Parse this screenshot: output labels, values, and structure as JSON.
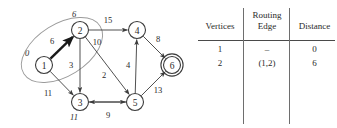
{
  "graph": {
    "nodes": [
      {
        "id": "1",
        "label": "1",
        "cx": 44,
        "cy": 65,
        "distance": "0",
        "dist_dx": -17,
        "dist_dy": -9,
        "highlighted": false
      },
      {
        "id": "2",
        "label": "2",
        "cx": 80,
        "cy": 30,
        "distance": "6",
        "dist_dx": -6,
        "dist_dy": -13,
        "highlighted": false
      },
      {
        "id": "3",
        "label": "3",
        "cx": 80,
        "cy": 102,
        "distance": "11",
        "dist_dx": -6,
        "dist_dy": 18,
        "highlighted": false
      },
      {
        "id": "4",
        "label": "4",
        "cx": 137,
        "cy": 30,
        "distance": "",
        "dist_dx": 0,
        "dist_dy": 0,
        "highlighted": false
      },
      {
        "id": "5",
        "label": "5",
        "cx": 135,
        "cy": 102,
        "distance": "",
        "dist_dx": 0,
        "dist_dy": 0,
        "highlighted": false
      },
      {
        "id": "6",
        "label": "6",
        "cx": 172,
        "cy": 65,
        "distance": "",
        "dist_dx": 0,
        "dist_dy": 0,
        "highlighted": true
      }
    ],
    "edges": [
      {
        "from": "1",
        "to": "2",
        "weight": "6",
        "wx": 52,
        "wy": 44,
        "thick": true
      },
      {
        "from": "1",
        "to": "3",
        "weight": "11",
        "wx": 48,
        "wy": 96,
        "thick": false
      },
      {
        "from": "2",
        "to": "3",
        "weight": "3",
        "wx": 71,
        "wy": 68,
        "thick": false
      },
      {
        "from": "2",
        "to": "4",
        "weight": "15",
        "wx": 108,
        "wy": 23,
        "thick": false
      },
      {
        "from": "2",
        "to": "5",
        "weight": "10",
        "wx": 97,
        "wy": 45,
        "thick": false
      },
      {
        "from": "3",
        "to": "5",
        "weight": "9",
        "wx": 108,
        "wy": 118,
        "thick": false
      },
      {
        "from": "5",
        "to": "3",
        "weight": "2",
        "wx": 104,
        "wy": 78,
        "thick": false
      },
      {
        "from": "5",
        "to": "4",
        "weight": "4",
        "wx": 128,
        "wy": 68,
        "thick": false
      },
      {
        "from": "4",
        "to": "6",
        "weight": "8",
        "wx": 158,
        "wy": 42,
        "thick": false
      },
      {
        "from": "5",
        "to": "6",
        "weight": "13",
        "wx": 158,
        "wy": 93,
        "thick": false
      }
    ],
    "selection_cloud": {
      "label": "selection-ellipse",
      "cx": 62,
      "cy": 50,
      "rx": 45,
      "ry": 26,
      "rotate": -32
    },
    "colors": {
      "stroke": "#3c3c3c",
      "highlight": "#1a1a1a",
      "cloud": "#9a9a9a",
      "node_fill": "#ffffff"
    }
  },
  "table": {
    "headers": {
      "vertices": "Vertices",
      "routing_edge_line1": "Routing",
      "routing_edge_line2": "Edge",
      "distance": "Distance"
    },
    "rows": [
      {
        "vertex": "1",
        "routing_edge": "–",
        "distance": "0"
      },
      {
        "vertex": "2",
        "routing_edge": "(1,2)",
        "distance": "6"
      }
    ]
  }
}
